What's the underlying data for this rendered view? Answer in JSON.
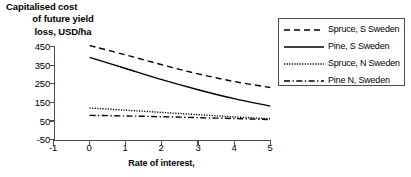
{
  "chart_data": {
    "type": "line",
    "title": "",
    "ylabel_lines": [
      "Capitalised cost",
      "of future yield",
      "loss, USD/ha"
    ],
    "ylabel": "Capitalised cost of future yield loss, USD/ha",
    "xlabel": "Rate of interest,",
    "xlim": [
      -1,
      5
    ],
    "ylim": [
      -50,
      450
    ],
    "xticks": [
      -1,
      0,
      1,
      2,
      3,
      4,
      5
    ],
    "yticks": [
      450,
      350,
      250,
      150,
      50,
      -50
    ],
    "xtick_labels": [
      "-1",
      "0",
      "1",
      "2",
      "3",
      "4",
      "5"
    ],
    "ytick_labels": [
      "450",
      "350",
      "250",
      "150",
      "50",
      "-50"
    ],
    "grid": false,
    "legend_position": "right",
    "x": [
      0,
      1,
      2,
      3,
      4,
      5
    ],
    "series": [
      {
        "name": "Spruce, S Sweden",
        "style": "dashed",
        "color": "#000000",
        "values": [
          455,
          405,
          352,
          303,
          262,
          230
        ]
      },
      {
        "name": "Pine, S Sweden",
        "style": "solid",
        "color": "#000000",
        "values": [
          392,
          332,
          272,
          218,
          170,
          130
        ]
      },
      {
        "name": "Spruce, N Sweden",
        "style": "dotted",
        "color": "#000000",
        "values": [
          120,
          108,
          96,
          84,
          72,
          62
        ]
      },
      {
        "name": "Pine N, Sweden",
        "style": "dashdot",
        "color": "#000000",
        "values": [
          80,
          77,
          73,
          68,
          63,
          58
        ]
      }
    ]
  },
  "legend": {
    "entries": [
      {
        "label": "Spruce, S Sweden"
      },
      {
        "label": "Pine, S Sweden"
      },
      {
        "label": "Spruce, N Sweden"
      },
      {
        "label": "Pine N, Sweden"
      }
    ]
  },
  "colors": {
    "line": "#000000",
    "axis": "#4d4d4d",
    "background": "#ffffff"
  }
}
